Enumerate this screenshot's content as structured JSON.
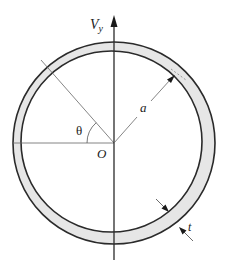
{
  "figure": {
    "colors": {
      "wall_fill": "#e6e6e6",
      "stroke": "#2a2a2a",
      "thin_line": "#555555",
      "background": "#ffffff"
    },
    "labels": {
      "force": "V",
      "force_subscript": "y",
      "angle": "θ",
      "origin": "O",
      "radius": "a",
      "thickness": "t"
    },
    "geometry": {
      "center": [
        114,
        143
      ],
      "outer_radius": 101,
      "inner_center": [
        111.5,
        141.5
      ],
      "inner_radius": 90.5,
      "axis_top_y": 16,
      "axis_bottom_y": 260,
      "horizontal_left_x": 12
    }
  }
}
